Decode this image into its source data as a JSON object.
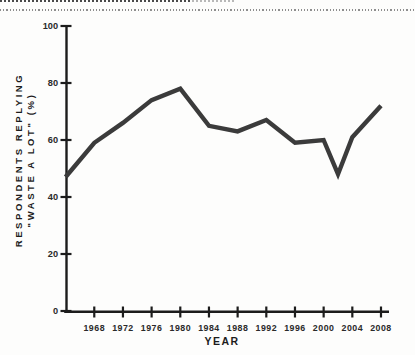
{
  "page": {
    "background": "#fdfdfc"
  },
  "decorations": {
    "torn_edge_dark_color": "#4a4a4a",
    "torn_edge_light_color": "#b8b8b8",
    "dotted_rule_color": "#8e8e8e"
  },
  "chart_data": {
    "type": "line",
    "title": "",
    "xlabel": "YEAR",
    "ylabel_line1": "RESPONDENTS REPLYING",
    "ylabel_line2": "\"WASTE A LOT\" (%)",
    "x": [
      1964,
      1968,
      1972,
      1976,
      1980,
      1984,
      1988,
      1992,
      1996,
      2000,
      2002,
      2004,
      2008
    ],
    "values": [
      47,
      59,
      66,
      74,
      78,
      65,
      63,
      67,
      59,
      60,
      48,
      61,
      72
    ],
    "x_ticks": [
      1968,
      1972,
      1976,
      1980,
      1984,
      1988,
      1992,
      1996,
      2000,
      2004,
      2008
    ],
    "y_ticks": [
      0,
      20,
      40,
      60,
      80,
      100
    ],
    "xlim": [
      1964,
      2009
    ],
    "ylim": [
      0,
      100
    ],
    "grid": false,
    "legend": null,
    "line_color": "#3b3b3b",
    "axis_color": "#1c1c1c",
    "tick_label_color": "#2a2a2a"
  }
}
